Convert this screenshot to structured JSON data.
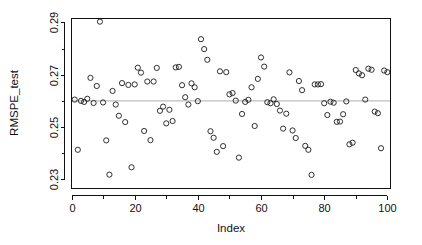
{
  "chart_data": {
    "type": "scatter",
    "title": "",
    "xlabel": "Index",
    "ylabel": "RMSPE_test",
    "xlim": [
      0,
      101
    ],
    "ylim": [
      0.2265,
      0.2915
    ],
    "grid": false,
    "legend": null,
    "x_ticks": [
      0,
      20,
      40,
      60,
      80,
      100
    ],
    "x_tick_labels": [
      "0",
      "20",
      "40",
      "60",
      "80",
      "100"
    ],
    "x_minor_ticks": [
      10,
      30,
      50,
      70,
      90
    ],
    "y_ticks": [
      0.23,
      0.25,
      0.27,
      0.29
    ],
    "y_tick_labels": [
      "0.23",
      "0.25",
      "0.27",
      "0.29"
    ],
    "y_minor_ticks": [
      0.24,
      0.26,
      0.28
    ],
    "point_marker": "open-circle",
    "point_color": "#1a1a1a",
    "reference_line": {
      "orientation": "horizontal",
      "y": 0.26,
      "color": "#bdbdbd"
    },
    "x": [
      1,
      2,
      3,
      4,
      5,
      6,
      7,
      8,
      9,
      10,
      11,
      12,
      13,
      14,
      15,
      16,
      17,
      18,
      19,
      20,
      21,
      22,
      23,
      24,
      25,
      26,
      27,
      28,
      29,
      30,
      31,
      32,
      33,
      34,
      35,
      36,
      37,
      38,
      39,
      40,
      41,
      42,
      43,
      44,
      45,
      46,
      47,
      48,
      49,
      50,
      51,
      52,
      53,
      54,
      55,
      56,
      57,
      58,
      59,
      60,
      61,
      62,
      63,
      64,
      65,
      66,
      67,
      68,
      69,
      70,
      71,
      72,
      73,
      74,
      75,
      76,
      77,
      78,
      79,
      80,
      81,
      82,
      83,
      84,
      85,
      86,
      87,
      88,
      89,
      90,
      91,
      92,
      93,
      94,
      95,
      96,
      97,
      98,
      99,
      100
    ],
    "y": [
      0.2605,
      0.2413,
      0.26,
      0.2596,
      0.2608,
      0.2688,
      0.2592,
      0.2657,
      0.2903,
      0.2594,
      0.2449,
      0.2318,
      0.2638,
      0.2586,
      0.2543,
      0.2668,
      0.2519,
      0.2661,
      0.2346,
      0.2663,
      0.2727,
      0.2708,
      0.2485,
      0.2674,
      0.245,
      0.2674,
      0.2726,
      0.2562,
      0.2578,
      0.2514,
      0.2566,
      0.2523,
      0.2728,
      0.273,
      0.266,
      0.2614,
      0.2586,
      0.2667,
      0.2652,
      0.2599,
      0.2836,
      0.2798,
      0.2757,
      0.2484,
      0.2459,
      0.2405,
      0.2713,
      0.2427,
      0.271,
      0.2625,
      0.263,
      0.2601,
      0.2383,
      0.255,
      0.2596,
      0.2604,
      0.2652,
      0.2504,
      0.2684,
      0.2766,
      0.2731,
      0.2595,
      0.2591,
      0.2606,
      0.2588,
      0.2563,
      0.2494,
      0.2551,
      0.2709,
      0.2487,
      0.2458,
      0.2676,
      0.2641,
      0.2428,
      0.2413,
      0.2317,
      0.2663,
      0.2663,
      0.2664,
      0.2591,
      0.2546,
      0.2597,
      0.2593,
      0.252,
      0.2521,
      0.2549,
      0.2598,
      0.2434,
      0.244,
      0.2718,
      0.2705,
      0.2698,
      0.2605,
      0.2723,
      0.2719,
      0.2559,
      0.2553,
      0.2419,
      0.2716,
      0.271
    ]
  }
}
